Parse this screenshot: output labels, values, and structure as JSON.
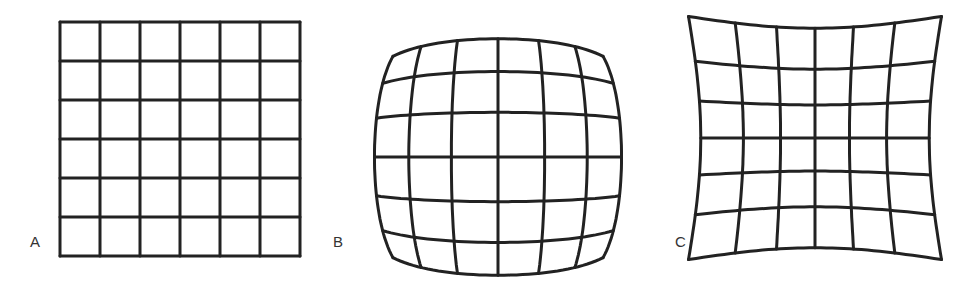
{
  "figure": {
    "panels": [
      {
        "id": "A",
        "label": "A",
        "type": "regular-grid",
        "rows": 6,
        "cols": 6,
        "label_pos": [
          30,
          233
        ]
      },
      {
        "id": "B",
        "label": "B",
        "type": "barrel-distortion-grid",
        "rows": 6,
        "cols": 6,
        "label_pos": [
          333,
          233
        ]
      },
      {
        "id": "C",
        "label": "C",
        "type": "pincushion-distortion-grid",
        "rows": 6,
        "cols": 6,
        "label_pos": [
          675,
          233
        ]
      }
    ],
    "line_color": "#222222"
  }
}
